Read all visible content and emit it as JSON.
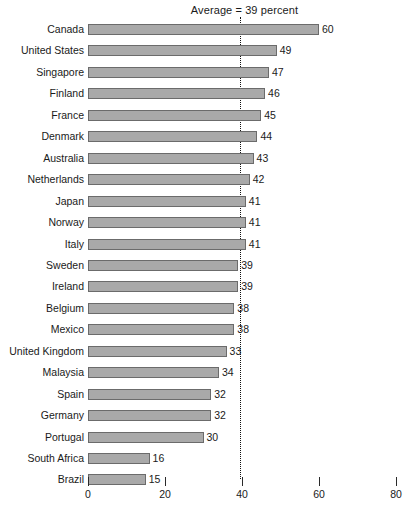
{
  "chart_data": {
    "type": "bar",
    "orientation": "horizontal",
    "title": "Average = 39 percent",
    "xlabel": "",
    "ylabel": "",
    "xlim": [
      0,
      80
    ],
    "xticks": [
      0,
      20,
      40,
      60,
      80
    ],
    "xtick_labels": [
      "0",
      "20",
      "40",
      "60",
      "80"
    ],
    "grid": false,
    "legend": null,
    "annotations": [
      {
        "name": "average-line",
        "label": "Average = 39 percent",
        "value": 39,
        "style": "dotted-vertical"
      }
    ],
    "categories": [
      "Canada",
      "United States",
      "Singapore",
      "Finland",
      "France",
      "Denmark",
      "Australia",
      "Netherlands",
      "Japan",
      "Norway",
      "Italy",
      "Sweden",
      "Ireland",
      "Belgium",
      "Mexico",
      "United Kingdom",
      "Malaysia",
      "Spain",
      "Germany",
      "Portugal",
      "South Africa",
      "Brazil"
    ],
    "values": [
      60,
      49,
      47,
      46,
      45,
      44,
      43,
      42,
      41,
      41,
      41,
      39,
      39,
      38,
      38,
      33,
      34,
      32,
      32,
      30,
      16,
      15
    ],
    "bar_lengths": [
      60,
      49,
      47,
      46,
      45,
      44,
      43,
      42,
      41,
      41,
      41,
      39,
      39,
      38,
      38,
      36,
      34,
      32,
      32,
      30,
      16,
      15
    ],
    "value_labels": [
      "60",
      "49",
      "47",
      "46",
      "45",
      "44",
      "43",
      "42",
      "41",
      "41",
      "41",
      "39",
      "39",
      "38",
      "38",
      "33",
      "34",
      "32",
      "32",
      "30",
      "16",
      "15"
    ],
    "colors": {
      "bar_fill": "#a9a9a9",
      "bar_border": "#6b6b6b",
      "text": "#1a1a1a",
      "background": "#ffffff",
      "average_line": "#111111"
    }
  }
}
